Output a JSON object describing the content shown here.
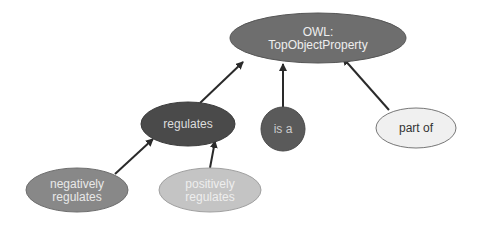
{
  "diagram": {
    "nodes": [
      {
        "id": "top",
        "lines": [
          "OWL:",
          "TopObjectProperty"
        ],
        "cx": 318,
        "cy": 38,
        "rx": 88,
        "ry": 25,
        "fill": "#6e6e6e",
        "stroke": "#555555",
        "text_color": "#eeeeee"
      },
      {
        "id": "regulates",
        "lines": [
          "regulates"
        ],
        "cx": 188,
        "cy": 124,
        "rx": 47,
        "ry": 22,
        "fill": "#4a4a4a",
        "stroke": "#3a3a3a",
        "text_color": "#dddddd"
      },
      {
        "id": "is_a",
        "lines": [
          "is a"
        ],
        "cx": 283,
        "cy": 129,
        "rx": 22,
        "ry": 22,
        "fill": "#5a5a5a",
        "stroke": "#4a4a4a",
        "text_color": "#cccccc"
      },
      {
        "id": "part_of",
        "lines": [
          "part of"
        ],
        "cx": 416,
        "cy": 128,
        "rx": 40,
        "ry": 20,
        "fill": "#f0f0f0",
        "stroke": "#777777",
        "text_color": "#333333"
      },
      {
        "id": "neg_regulates",
        "lines": [
          "negatively",
          "regulates"
        ],
        "cx": 77,
        "cy": 190,
        "rx": 51,
        "ry": 22,
        "fill": "#888888",
        "stroke": "#6e6e6e",
        "text_color": "#e8e8e8"
      },
      {
        "id": "pos_regulates",
        "lines": [
          "positively",
          "regulates"
        ],
        "cx": 210,
        "cy": 190,
        "rx": 51,
        "ry": 22,
        "fill": "#c4c4c4",
        "stroke": "#a0a0a0",
        "text_color": "#eeeeee"
      }
    ],
    "edges": [
      {
        "from": "regulates",
        "to": "top",
        "x1": 200,
        "y1": 103,
        "x2": 243,
        "y2": 62
      },
      {
        "from": "is_a",
        "to": "top",
        "x1": 283,
        "y1": 107,
        "x2": 283,
        "y2": 64
      },
      {
        "from": "part_of",
        "to": "top",
        "x1": 389,
        "y1": 110,
        "x2": 343,
        "y2": 58
      },
      {
        "from": "neg_regulates",
        "to": "regulates",
        "x1": 115,
        "y1": 174,
        "x2": 153,
        "y2": 139
      },
      {
        "from": "pos_regulates",
        "to": "regulates",
        "x1": 210,
        "y1": 168,
        "x2": 215,
        "y2": 141
      }
    ],
    "edge_color": "#2a2a2a"
  }
}
